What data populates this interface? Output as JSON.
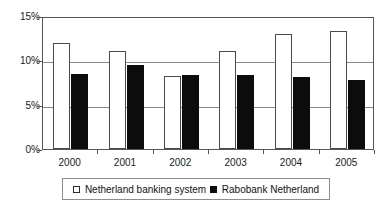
{
  "chart_data": {
    "type": "bar",
    "title": "",
    "subtitle": "",
    "xlabel": "",
    "ylabel": "",
    "categories": [
      "2000",
      "2001",
      "2002",
      "2003",
      "2004",
      "2005"
    ],
    "series": [
      {
        "name": "Netherland banking system",
        "color": "#ffffff",
        "edge_color": "#4a4a4a",
        "values": [
          12.0,
          11.0,
          8.2,
          11.0,
          13.0,
          13.3
        ]
      },
      {
        "name": "Rabobank Netherland",
        "color": "#0c0c0c",
        "edge_color": "#0c0c0c",
        "values": [
          8.5,
          9.5,
          8.3,
          8.4,
          8.1,
          7.8
        ]
      }
    ],
    "ylim": [
      0,
      15
    ],
    "yticks": [
      0,
      5,
      10,
      15
    ],
    "ytick_labels": [
      "0%",
      "5%",
      "10%",
      "15%"
    ],
    "grid": true,
    "grid_axis": "y",
    "legend_position": "bottom",
    "value_unit": "%"
  },
  "legend": {
    "entries": [
      {
        "label": "Netherland banking system",
        "marker": "light-square-marker"
      },
      {
        "label": "Rabobank Netherland",
        "marker": "dark-square-marker"
      }
    ]
  }
}
